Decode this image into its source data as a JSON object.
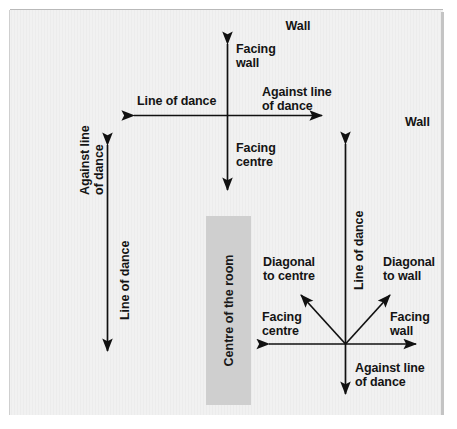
{
  "figure": {
    "background_color": "#ececec",
    "block_color": "#cfcfcf",
    "line_color": "#111111"
  },
  "walls": {
    "top_label": "Wall",
    "right_label": "Wall"
  },
  "centre_block": {
    "label": "Centre of the room"
  },
  "cross_top": {
    "up_label": "Facing\nwall",
    "down_label": "Facing\ncentre",
    "left_label": "Line of dance",
    "right_label": "Against line\nof dance"
  },
  "left_axis": {
    "up_label": "Against line\nof dance",
    "down_label": "Line of dance"
  },
  "star_bottom": {
    "up_label": "Line of dance",
    "down_label": "Against line\nof dance",
    "left_label": "Facing\ncentre",
    "right_label": "Facing\nwall",
    "diag_up_left_label": "Diagonal\nto centre",
    "diag_up_right_label": "Diagonal\nto wall"
  }
}
